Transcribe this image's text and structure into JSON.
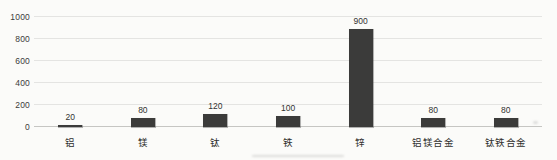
{
  "chart_data": {
    "type": "bar",
    "categories": [
      "铝",
      "镁",
      "钛",
      "铁",
      "锌",
      "铝镁合金",
      "钛铁合金"
    ],
    "values": [
      20,
      80,
      120,
      100,
      900,
      80,
      80
    ],
    "title": "",
    "xlabel": "",
    "ylabel": "",
    "ylim": [
      0,
      1000
    ],
    "yticks": [
      0,
      200,
      400,
      600,
      800,
      1000
    ],
    "grid": true,
    "legend_visible": false,
    "bar_color": "#3b3b3a",
    "gridline_color": "#e4e4e2",
    "baseline_color": "#c6c6c3",
    "tick_label_color": "#3b3b3b",
    "value_label_color": "#333331",
    "category_label_color": "#2f2f2d",
    "background_color": "#fbfbf9"
  }
}
